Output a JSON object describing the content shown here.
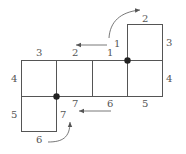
{
  "diagram": {
    "type": "cube-net-edge-labeling",
    "colors": {
      "line": "#555555",
      "dot": "#222222",
      "background": "#ffffff"
    },
    "squares": [
      {
        "id": "top",
        "x": 127,
        "y": 24,
        "w": 35,
        "h": 36
      },
      {
        "id": "row-1",
        "x": 21,
        "y": 60,
        "w": 35,
        "h": 36
      },
      {
        "id": "row-2",
        "x": 56,
        "y": 60,
        "w": 36,
        "h": 36
      },
      {
        "id": "row-3",
        "x": 92,
        "y": 60,
        "w": 35,
        "h": 36
      },
      {
        "id": "row-4",
        "x": 127,
        "y": 60,
        "w": 35,
        "h": 36
      },
      {
        "id": "bottom",
        "x": 21,
        "y": 96,
        "w": 35,
        "h": 36
      }
    ],
    "dots": [
      {
        "id": "dot-upper",
        "x": 127,
        "y": 60
      },
      {
        "id": "dot-lower",
        "x": 56,
        "y": 96
      }
    ],
    "labels": {
      "top_left_edge": "1",
      "top_top_edge": "2",
      "top_right_edge": "3",
      "row_top_1": "3",
      "row_top_2": "2",
      "row_top_3": "1",
      "row_left_edge": "4",
      "row_right_edge": "4",
      "row_bottom_2": "7",
      "row_bottom_3": "6",
      "row_bottom_4": "5",
      "bottom_left_edge": "5",
      "bottom_bottom_edge": "6",
      "bottom_right_edge": "7"
    },
    "arrows": [
      {
        "id": "arrow-top-curve",
        "description": "curved arrow from edge 1 up to edge 2"
      },
      {
        "id": "arrow-top-left",
        "description": "left-pointing arrow above row top edges"
      },
      {
        "id": "arrow-bottom-left",
        "description": "left-pointing arrow below row bottom edges"
      },
      {
        "id": "arrow-bottom-curve",
        "description": "curved arrow from edge 6 up to edge 7"
      }
    ]
  }
}
